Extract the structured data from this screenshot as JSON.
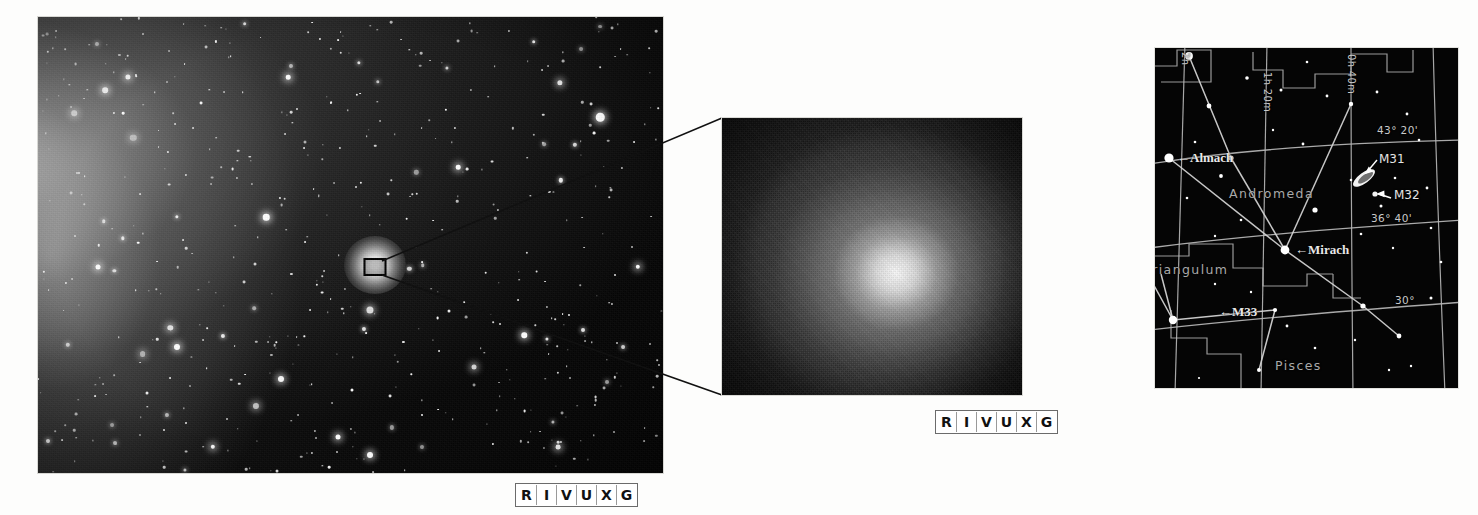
{
  "figure": {
    "background_color": "#ffffff"
  },
  "main_image": {
    "name": "wide-field photograph of M31 region with M32 companion",
    "caption_badge": [
      "R",
      "I",
      "V",
      "U",
      "X",
      "G"
    ],
    "nucleus_box_label": "nucleus region marker"
  },
  "inset_image": {
    "name": "magnified close-up of the M32 nucleus",
    "caption_badge": [
      "R",
      "I",
      "V",
      "U",
      "X",
      "G"
    ]
  },
  "star_chart": {
    "name": "Andromeda finder chart",
    "stars": [
      {
        "label": "Almach",
        "arrow": "←"
      },
      {
        "label": "Mirach",
        "arrow": "←"
      }
    ],
    "objects": [
      {
        "label": "M31"
      },
      {
        "label": "M32"
      },
      {
        "label": "M33",
        "arrow": "←"
      }
    ],
    "constellations": [
      {
        "label": "Andromeda"
      },
      {
        "label": "Triangulum"
      },
      {
        "label": "Pisces"
      }
    ],
    "right_ascension_labels": [
      {
        "label": "2h"
      },
      {
        "label": "1h 20m"
      },
      {
        "label": "0h 40m"
      }
    ],
    "declination_labels": [
      {
        "label": "43° 20'"
      },
      {
        "label": "36° 40'"
      },
      {
        "label": "30°"
      }
    ]
  },
  "colors": {
    "page_background": "#ffffff",
    "sky_black": "#050505",
    "chart_line": "#b9b9b9",
    "star_white": "#ffffff",
    "constellation_label": "#a9a9a9",
    "badge_text": "#111111"
  }
}
